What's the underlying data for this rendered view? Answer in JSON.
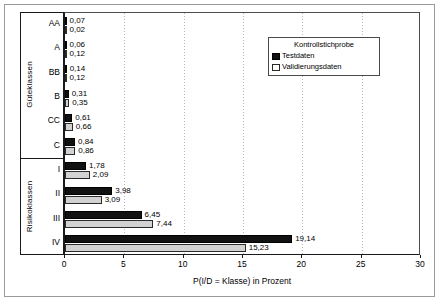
{
  "chart_data": {
    "type": "bar",
    "orientation": "horizontal",
    "title": "",
    "xlabel": "P(I/D = Klasse) in Prozent",
    "ylabel": "",
    "xlim": [
      0,
      30
    ],
    "xticks": [
      0,
      5,
      10,
      15,
      20,
      25,
      30
    ],
    "xtick_labels": [
      "0",
      "5",
      "10",
      "15",
      "20",
      "25",
      "30"
    ],
    "grid": true,
    "grid_axis": "x",
    "legend_position": "top-right",
    "legend_title": "Kontrollstichprobe",
    "categories": [
      "AA",
      "A",
      "BB",
      "B",
      "CC",
      "C",
      "I",
      "II",
      "III",
      "IV"
    ],
    "category_groups": [
      {
        "name": "Güteklassen",
        "categories": [
          "AA",
          "A",
          "BB",
          "B",
          "CC",
          "C"
        ]
      },
      {
        "name": "Risikoklassen",
        "categories": [
          "I",
          "II",
          "III",
          "IV"
        ]
      }
    ],
    "series": [
      {
        "name": "Testdaten",
        "color": "#111111",
        "values": [
          0.07,
          0.06,
          0.14,
          0.31,
          0.61,
          0.84,
          1.78,
          3.98,
          6.45,
          19.14
        ],
        "labels": [
          "0,07",
          "0,06",
          "0,14",
          "0,31",
          "0,61",
          "0,84",
          "1,78",
          "3,98",
          "6,45",
          "19,14"
        ]
      },
      {
        "name": "Validierungsdaten",
        "color": "#d2d2d2",
        "values": [
          0.02,
          0.12,
          0.12,
          0.35,
          0.66,
          0.86,
          2.09,
          3.09,
          7.44,
          15.23
        ],
        "labels": [
          "0,02",
          "0,12",
          "0,12",
          "0,35",
          "0,66",
          "0,86",
          "2,09",
          "3,09",
          "7,44",
          "15,23"
        ]
      }
    ]
  },
  "legend": {
    "title": "Kontrollstichprobe",
    "entries": [
      {
        "label": "Testdaten"
      },
      {
        "label": "Validierungsdaten"
      }
    ]
  },
  "axis": {
    "x_title": "P(I/D = Klasse) in Prozent",
    "ticks": [
      "0",
      "5",
      "10",
      "15",
      "20",
      "25",
      "30"
    ]
  },
  "groups": {
    "upper": "Güteklassen",
    "lower": "Risikoklassen"
  }
}
